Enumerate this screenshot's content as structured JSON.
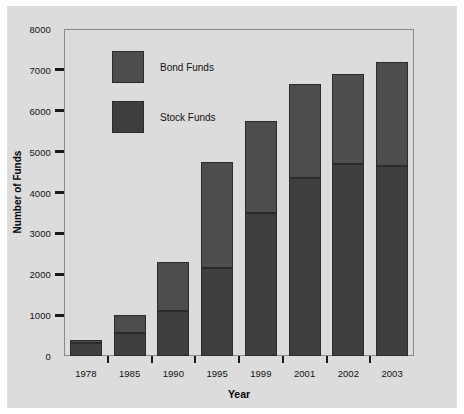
{
  "chart_data": {
    "type": "bar",
    "subtype": "stacked-bar",
    "title": "",
    "xlabel": "Year",
    "ylabel": "Number of Funds",
    "categories": [
      "1978",
      "1985",
      "1990",
      "1995",
      "1999",
      "2001",
      "2002",
      "2003"
    ],
    "series": [
      {
        "name": "Stock Funds",
        "color": "#3f3f3f",
        "values": [
          330,
          570,
          1100,
          2150,
          3500,
          4350,
          4700,
          4650
        ]
      },
      {
        "name": "Bond Funds",
        "color": "#4d4d4d",
        "values": [
          70,
          430,
          1200,
          2600,
          2250,
          2300,
          2200,
          2550
        ]
      }
    ],
    "totals": [
      400,
      1000,
      2300,
      4750,
      5750,
      6650,
      6900,
      7200
    ],
    "ylim": [
      0,
      8000
    ],
    "yticks": [
      0,
      1000,
      2000,
      3000,
      4000,
      5000,
      6000,
      7000,
      8000
    ],
    "ytick_labels": [
      "0",
      "1000",
      "2000",
      "3000",
      "4000",
      "5000",
      "6000",
      "7000",
      "8000"
    ],
    "grid": false,
    "legend_position": "upper-left-inside",
    "legend": [
      {
        "label": "Bond Funds",
        "color": "#4d4d4d"
      },
      {
        "label": "Stock Funds",
        "color": "#3f3f3f"
      }
    ]
  },
  "colors": {
    "figure_background": "#dcdcdc",
    "page_background": "#ffffff",
    "axis": "#1a1a1a",
    "frame": "#8a8a8a",
    "bar_outline": "#2b2b2b",
    "text": "#111111"
  }
}
